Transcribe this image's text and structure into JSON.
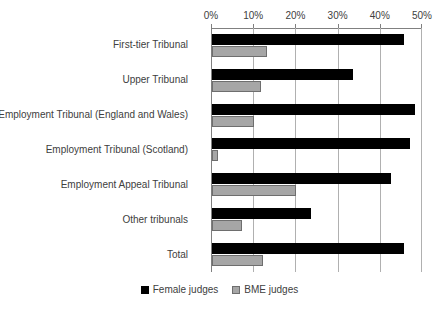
{
  "chart_data": {
    "type": "bar",
    "orientation": "horizontal",
    "title": "",
    "subtitle": "",
    "xlabel": "",
    "ylabel": "",
    "xlim": [
      0,
      50
    ],
    "xunit": "%",
    "grid": true,
    "legend_position": "bottom",
    "axis_ticks": [
      "0%",
      "10%",
      "20%",
      "30%",
      "40%",
      "50%"
    ],
    "axis_tick_values": [
      0,
      10,
      20,
      30,
      40,
      50
    ],
    "categories": [
      "First-tier Tribunal",
      "Upper Tribunal",
      "Employment Tribunal (England and Wales)",
      "Employment Tribunal (Scotland)",
      "Employment Appeal Tribunal",
      "Other tribunals",
      "Total"
    ],
    "series": [
      {
        "name": "Female judges",
        "color": "#000000",
        "values": [
          45.5,
          33.5,
          48.0,
          47.0,
          42.5,
          23.5,
          45.5
        ]
      },
      {
        "name": "BME judges",
        "color": "#a6a6a6",
        "values": [
          13.0,
          11.5,
          10.0,
          1.5,
          20.0,
          7.0,
          12.0
        ]
      }
    ]
  },
  "legend": {
    "items": [
      {
        "label": "Female judges"
      },
      {
        "label": "BME judges"
      }
    ]
  }
}
